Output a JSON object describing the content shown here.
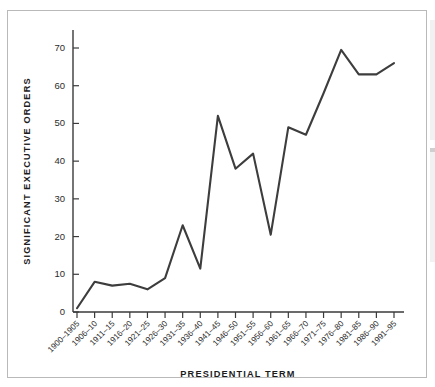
{
  "figure": {
    "background_color": "#ffffff",
    "border_color": "#b9b9b9",
    "line_color": "#3d3d3d",
    "axis_color": "#3a3a3a",
    "text_color": "#1c1c1c"
  },
  "chart_data": {
    "type": "line",
    "title": "",
    "xlabel": "PRESIDENTIAL TERM",
    "ylabel": "SIGNIFICANT EXECUTIVE ORDERS",
    "categories": [
      "1900–1905",
      "1906–10",
      "1911–15",
      "1916–20",
      "1921–25",
      "1926–30",
      "1931–35",
      "1936–40",
      "1941–45",
      "1946–50",
      "1951–55",
      "1956–60",
      "1961–65",
      "1966–70",
      "1971–75",
      "1976–80",
      "1981–85",
      "1986–90",
      "1991–95"
    ],
    "values": [
      1,
      8,
      7,
      7.5,
      6,
      9,
      23,
      11.5,
      52,
      38,
      42,
      20.5,
      49,
      47,
      58,
      69.5,
      63,
      63,
      66
    ],
    "ylim": [
      0,
      75
    ],
    "yticks": [
      0,
      10,
      20,
      30,
      40,
      50,
      60,
      70
    ],
    "ytick_labels": [
      "0",
      "10",
      "20",
      "30",
      "40",
      "50",
      "60",
      "70"
    ],
    "grid": false,
    "legend": "none",
    "series": [
      {
        "name": "Significant Executive Orders",
        "color": "#3d3d3d",
        "values": [
          1,
          8,
          7,
          7.5,
          6,
          9,
          23,
          11.5,
          52,
          38,
          42,
          20.5,
          49,
          47,
          58,
          69.5,
          63,
          63,
          66
        ]
      }
    ]
  }
}
